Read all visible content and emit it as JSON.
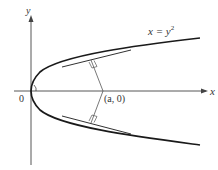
{
  "diagram": {
    "axes": {
      "x_label": "x",
      "y_label": "y",
      "origin_label": "0"
    },
    "curve": {
      "equation_label": "x = y",
      "equation_exponent": "2"
    },
    "point": {
      "label": "(a, 0)"
    },
    "colors": {
      "curve": "#1a1a1a",
      "axis": "#444444",
      "normal": "#555555"
    }
  }
}
